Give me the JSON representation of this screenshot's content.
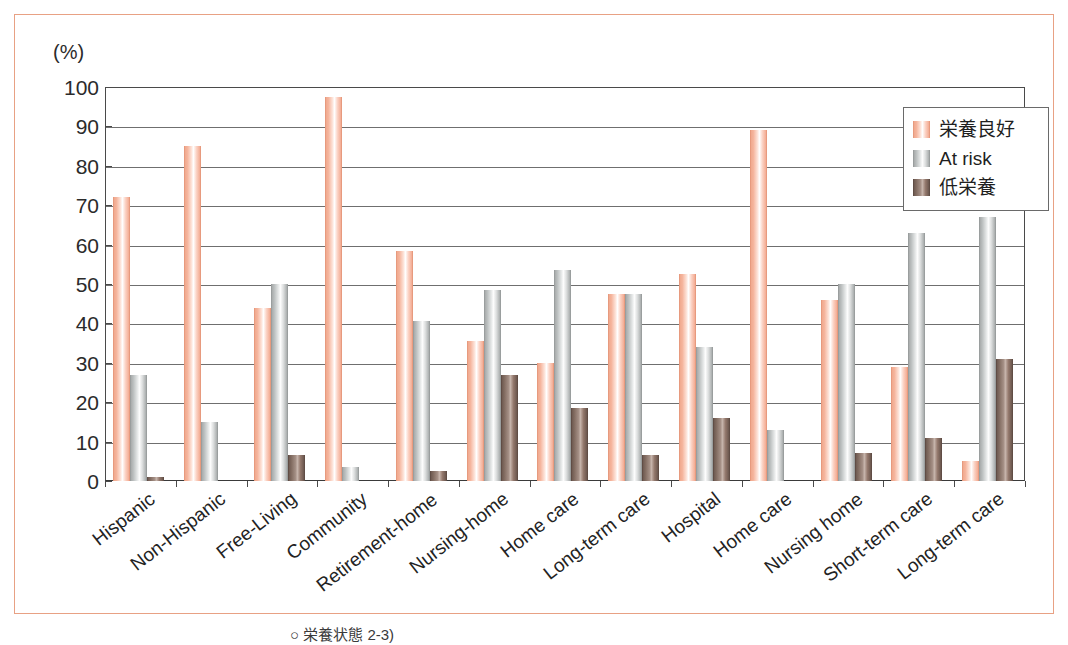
{
  "figure": {
    "axis_unit_label": "(%)",
    "frame_color": "#e8a184",
    "caption": "○ 栄養状態 2-3)"
  },
  "legend": {
    "position": "top-right",
    "items": [
      {
        "label": "栄養良好",
        "color": "#f3ab92",
        "swatch_name": "legend-swatch-good-nutrition"
      },
      {
        "label": "At risk",
        "color": "#b6baba",
        "swatch_name": "legend-swatch-at-risk"
      },
      {
        "label": "低栄養",
        "color": "#7d675c",
        "swatch_name": "legend-swatch-malnutrition"
      }
    ]
  },
  "chart_data": {
    "type": "bar",
    "title": "",
    "xlabel": "",
    "ylabel": "(%)",
    "ylim": [
      0,
      100
    ],
    "yticks": [
      0,
      10,
      20,
      30,
      40,
      50,
      60,
      70,
      80,
      90,
      100
    ],
    "ytick_labels": [
      "0",
      "10",
      "20",
      "30",
      "40",
      "50",
      "60",
      "70",
      "80",
      "90",
      "100"
    ],
    "grid": true,
    "grid_axis": "y",
    "legend_position": "upper right",
    "categories": [
      "Hispanic",
      "Non-Hispanic",
      "Free-Living",
      "Community",
      "Retirement-home",
      "Nursing-home",
      "Home care",
      "Long-term care",
      "Hospital",
      "Home care",
      "Nursing home",
      "Short-term care",
      "Long-term care"
    ],
    "series": [
      {
        "name": "栄養良好",
        "color": "#f3ab92",
        "values": [
          72,
          85,
          44,
          97.5,
          58.5,
          35.5,
          30,
          47.5,
          52.5,
          89,
          46,
          29,
          5
        ]
      },
      {
        "name": "At risk",
        "color": "#b6baba",
        "values": [
          27,
          15,
          50,
          3.5,
          40.5,
          48.5,
          53.5,
          47.5,
          34,
          13,
          50,
          63,
          67
        ]
      },
      {
        "name": "低栄養",
        "color": "#7d675c",
        "values": [
          1,
          0,
          6.5,
          0,
          2.5,
          27,
          18.5,
          6.5,
          16,
          0,
          7,
          11,
          31
        ]
      }
    ]
  }
}
